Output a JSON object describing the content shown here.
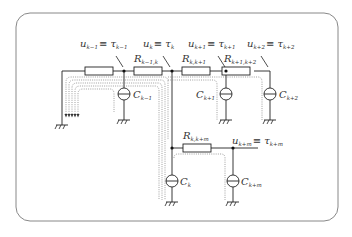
{
  "diagram": {
    "type": "RC circuit network (tree)",
    "frame_color": "#888888",
    "line_color": "#222222",
    "dotted_color": "#777777",
    "node_labels": [
      {
        "id": "n_km1",
        "base": "u",
        "sub": "k−1",
        "eq": "≡",
        "tau": "τ",
        "tau_sub": "k−1"
      },
      {
        "id": "n_k",
        "base": "u",
        "sub": "k",
        "eq": "≡",
        "tau": "τ",
        "tau_sub": "k"
      },
      {
        "id": "n_kp1",
        "base": "u",
        "sub": "k+1",
        "eq": "≡",
        "tau": "τ",
        "tau_sub": "k+1"
      },
      {
        "id": "n_kp2",
        "base": "u",
        "sub": "k+2",
        "eq": "≡",
        "tau": "τ",
        "tau_sub": "k+2"
      },
      {
        "id": "n_kpm",
        "base": "u",
        "sub": "k+m",
        "eq": "≡",
        "tau": "τ",
        "tau_sub": "k+m"
      }
    ],
    "resistors": [
      {
        "id": "r_left",
        "base": "",
        "sub": ""
      },
      {
        "id": "r_km1_k",
        "base": "R",
        "sub": "k−1,k"
      },
      {
        "id": "r_k_kp1",
        "base": "R",
        "sub": "k,k+1"
      },
      {
        "id": "r_kp1_kp2",
        "base": "R",
        "sub": "k+1,k+2"
      },
      {
        "id": "r_k_kpm",
        "base": "R",
        "sub": "k,k+m"
      }
    ],
    "sources": [
      {
        "id": "c_km1",
        "base": "C",
        "sub": "k−1"
      },
      {
        "id": "c_kp1",
        "base": "C",
        "sub": "k+1"
      },
      {
        "id": "c_kp2",
        "base": "C",
        "sub": "k+2"
      },
      {
        "id": "c_k",
        "base": "C",
        "sub": "k"
      },
      {
        "id": "c_kpm",
        "base": "C",
        "sub": "k+m"
      }
    ]
  },
  "labels": {
    "u_km1": "u",
    "u_km1_sub": "k−1",
    "tau_km1": "≡ τ",
    "tau_km1_sub": "k−1",
    "u_k": "u",
    "u_k_sub": "k",
    "tau_k": "≡ τ",
    "tau_k_sub": "k",
    "u_kp1": "u",
    "u_kp1_sub": "k+1",
    "tau_kp1": "≡ τ",
    "tau_kp1_sub": "k+1",
    "u_kp2": "u",
    "u_kp2_sub": "k+2",
    "tau_kp2": "≡ τ",
    "tau_kp2_sub": "k+2",
    "u_kpm": "u",
    "u_kpm_sub": "k+m",
    "tau_kpm": "≡ τ",
    "tau_kpm_sub": "k+m",
    "R_km1_k": "R",
    "R_km1_k_sub": "k−1,k",
    "R_k_kp1": "R",
    "R_k_kp1_sub": "k,k+1",
    "R_kp1_kp2": "R",
    "R_kp1_kp2_sub": "k+1,k+2",
    "R_k_kpm": "R",
    "R_k_kpm_sub": "k,k+m",
    "C_km1": "C",
    "C_km1_sub": "k−1",
    "C_kp1": "C",
    "C_kp1_sub": "k+1",
    "C_kp2": "C",
    "C_kp2_sub": "k+2",
    "C_k": "C",
    "C_k_sub": "k",
    "C_kpm": "C",
    "C_kpm_sub": "k+m"
  }
}
